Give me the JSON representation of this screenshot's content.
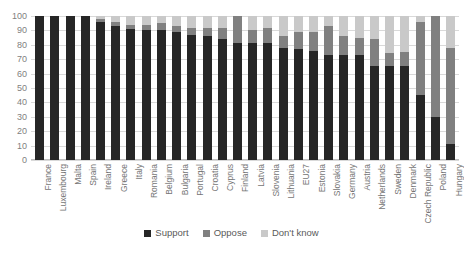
{
  "chart_data": {
    "type": "bar",
    "subtype": "stacked-bar-100",
    "title": "",
    "xlabel": "",
    "ylabel": "",
    "ylim": [
      0,
      100
    ],
    "yticks": [
      0,
      10,
      20,
      30,
      40,
      50,
      60,
      70,
      80,
      90,
      100
    ],
    "grid": true,
    "legend_position": "bottom",
    "categories": [
      "France",
      "Luxembourg",
      "Malta",
      "Spain",
      "Ireland",
      "Greece",
      "Italy",
      "Romania",
      "Belgium",
      "Bulgaria",
      "Portugal",
      "Croatia",
      "Cyprus",
      "Finland",
      "Latvia",
      "Slovenia",
      "Lithuania",
      "EU27",
      "Estonia",
      "Slovakia",
      "Germany",
      "Austria",
      "Netherlands",
      "Sweden",
      "Denmark",
      "Czech Republic",
      "Poland",
      "Hungary"
    ],
    "series": [
      {
        "name": "Support",
        "color": "#262626",
        "values": [
          100,
          100,
          100,
          100,
          96,
          93,
          91,
          90,
          90,
          89,
          87,
          86,
          84,
          81,
          81,
          81,
          78,
          77,
          76,
          73,
          73,
          73,
          65,
          65,
          65,
          45,
          30,
          11
        ]
      },
      {
        "name": "Oppose",
        "color": "#808080",
        "values": [
          0,
          0,
          0,
          0,
          2,
          3,
          3,
          4,
          5,
          4,
          5,
          6,
          8,
          19,
          9,
          11,
          8,
          12,
          13,
          20,
          13,
          12,
          19,
          9,
          10,
          51,
          70,
          67
        ]
      },
      {
        "name": "Don't know",
        "color": "#c9c9c9",
        "values": [
          0,
          0,
          0,
          0,
          2,
          4,
          6,
          6,
          5,
          7,
          8,
          8,
          8,
          0,
          10,
          8,
          14,
          11,
          11,
          7,
          14,
          15,
          16,
          26,
          25,
          4,
          0,
          22
        ]
      }
    ]
  },
  "legend": {
    "items": [
      {
        "label": "Support",
        "color": "#262626",
        "icon": "square-swatch-icon"
      },
      {
        "label": "Oppose",
        "color": "#808080",
        "icon": "square-swatch-icon"
      },
      {
        "label": "Don't know",
        "color": "#c9c9c9",
        "icon": "square-swatch-icon"
      }
    ]
  }
}
